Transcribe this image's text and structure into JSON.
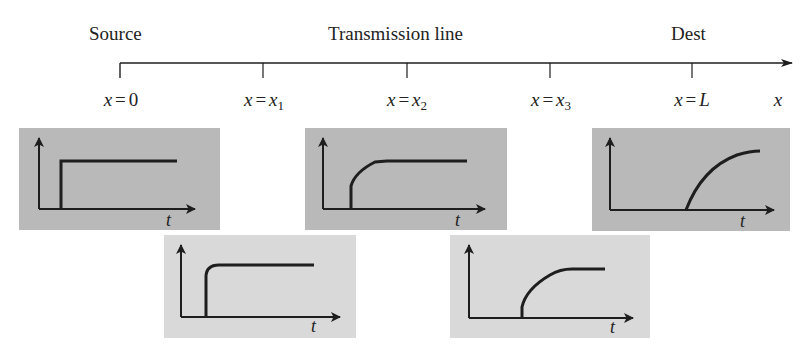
{
  "diagram": {
    "title_labels": {
      "source": "Source",
      "line": "Transmission line",
      "dest": "Dest"
    },
    "axis": {
      "label": "x",
      "positions": [
        {
          "var": "x",
          "eq": "=",
          "val": "0",
          "sub": ""
        },
        {
          "var": "x",
          "eq": "=",
          "val": "x",
          "sub": "1"
        },
        {
          "var": "x",
          "eq": "=",
          "val": "x",
          "sub": "2"
        },
        {
          "var": "x",
          "eq": "=",
          "val": "x",
          "sub": "3"
        },
        {
          "var": "x",
          "eq": "=",
          "val": "L",
          "sub": ""
        }
      ]
    },
    "panels": [
      {
        "id": "x0",
        "position": "x = 0",
        "waveform": "ideal step",
        "t_label": "t",
        "shade": "#b9b9b9"
      },
      {
        "id": "x1",
        "position": "x = x1",
        "waveform": "step with slightly rounded corner",
        "t_label": "t",
        "shade": "#d9d9d9"
      },
      {
        "id": "x2",
        "position": "x = x2",
        "waveform": "step with slower rise",
        "t_label": "t",
        "shade": "#b9b9b9"
      },
      {
        "id": "x3",
        "position": "x = x3",
        "waveform": "step with further delayed, slower rise",
        "t_label": "t",
        "shade": "#d9d9d9"
      },
      {
        "id": "xL",
        "position": "x = L",
        "waveform": "fully smoothed rise, largest delay",
        "t_label": "t",
        "shade": "#b9b9b9"
      }
    ],
    "colors": {
      "dark_panel": "#b9b9b9",
      "light_panel": "#d9d9d9",
      "stroke": "#1e1e1e",
      "background": "#ffffff"
    }
  }
}
